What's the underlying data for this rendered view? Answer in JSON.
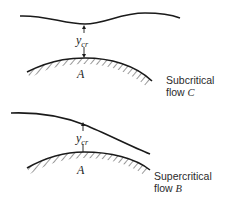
{
  "diagram": {
    "panels": [
      {
        "id": "subcritical",
        "depth_label": "y",
        "depth_subscript": "cr",
        "point_label": "A",
        "caption_line1": "Subcritical",
        "caption_line2_prefix": "flow ",
        "caption_line2_var": "C"
      },
      {
        "id": "supercritical",
        "depth_label": "y",
        "depth_subscript": "cr",
        "point_label": "A",
        "caption_line1": "Supercritical",
        "caption_line2_prefix": "flow ",
        "caption_line2_var": "B"
      }
    ],
    "colors": {
      "line": "#1a1a1a",
      "text": "#2a2a2a"
    }
  }
}
